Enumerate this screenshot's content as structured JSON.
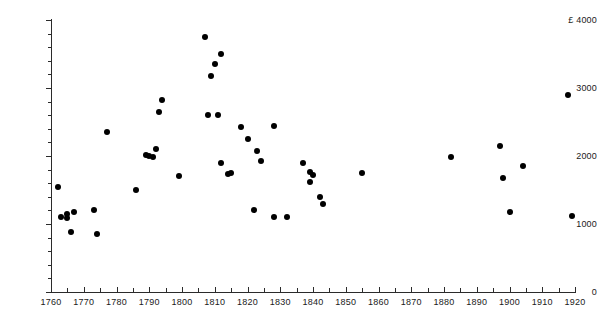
{
  "chart_data": {
    "type": "scatter",
    "title": "",
    "subtitle": "",
    "xlabel": "",
    "ylabel": "£ 4000",
    "currency_symbol": "£",
    "xlim": [
      1760,
      1920
    ],
    "ylim": [
      0,
      4000
    ],
    "grid": false,
    "legend": null,
    "x_ticks": [
      1760,
      1770,
      1780,
      1790,
      1800,
      1810,
      1820,
      1830,
      1840,
      1850,
      1860,
      1870,
      1880,
      1890,
      1900,
      1910,
      1920
    ],
    "x_tick_labels": [
      "1760",
      "1770",
      "1780",
      "1790",
      "1800",
      "1810",
      "1820",
      "1830",
      "1840",
      "1850",
      "1860",
      "1870",
      "1880",
      "1890",
      "1900",
      "1910",
      "1920"
    ],
    "x_minor_step": 5,
    "y_ticks": [
      0,
      1000,
      2000,
      3000,
      4000
    ],
    "y_tick_labels": [
      "0",
      "1000",
      "2000",
      "3000",
      "£ 4000"
    ],
    "y_minor_step": 200,
    "marker": "filled-circle",
    "marker_color": "#000000",
    "marker_size": 6,
    "points": [
      {
        "x": 1762,
        "y": 1550
      },
      {
        "x": 1763,
        "y": 1100
      },
      {
        "x": 1765,
        "y": 1150
      },
      {
        "x": 1765,
        "y": 1090
      },
      {
        "x": 1767,
        "y": 1180
      },
      {
        "x": 1766,
        "y": 880
      },
      {
        "x": 1773,
        "y": 1200
      },
      {
        "x": 1774,
        "y": 850
      },
      {
        "x": 1777,
        "y": 2350
      },
      {
        "x": 1786,
        "y": 1500
      },
      {
        "x": 1789,
        "y": 2020
      },
      {
        "x": 1790,
        "y": 2000
      },
      {
        "x": 1791,
        "y": 1990
      },
      {
        "x": 1792,
        "y": 2100
      },
      {
        "x": 1793,
        "y": 2640
      },
      {
        "x": 1794,
        "y": 2820
      },
      {
        "x": 1799,
        "y": 1700
      },
      {
        "x": 1807,
        "y": 3750
      },
      {
        "x": 1812,
        "y": 3500
      },
      {
        "x": 1810,
        "y": 3360
      },
      {
        "x": 1809,
        "y": 3180
      },
      {
        "x": 1808,
        "y": 2610
      },
      {
        "x": 1811,
        "y": 2600
      },
      {
        "x": 1812,
        "y": 1900
      },
      {
        "x": 1814,
        "y": 1740
      },
      {
        "x": 1815,
        "y": 1750
      },
      {
        "x": 1818,
        "y": 2430
      },
      {
        "x": 1820,
        "y": 2250
      },
      {
        "x": 1822,
        "y": 1200
      },
      {
        "x": 1823,
        "y": 2080
      },
      {
        "x": 1824,
        "y": 1930
      },
      {
        "x": 1828,
        "y": 1100
      },
      {
        "x": 1828,
        "y": 2440
      },
      {
        "x": 1832,
        "y": 1100
      },
      {
        "x": 1837,
        "y": 1900
      },
      {
        "x": 1839,
        "y": 1760
      },
      {
        "x": 1840,
        "y": 1720
      },
      {
        "x": 1839,
        "y": 1620
      },
      {
        "x": 1842,
        "y": 1400
      },
      {
        "x": 1843,
        "y": 1300
      },
      {
        "x": 1855,
        "y": 1750
      },
      {
        "x": 1882,
        "y": 1990
      },
      {
        "x": 1897,
        "y": 2150
      },
      {
        "x": 1898,
        "y": 1680
      },
      {
        "x": 1904,
        "y": 1850
      },
      {
        "x": 1900,
        "y": 1170
      },
      {
        "x": 1918,
        "y": 2900
      },
      {
        "x": 1919,
        "y": 1120
      }
    ]
  }
}
